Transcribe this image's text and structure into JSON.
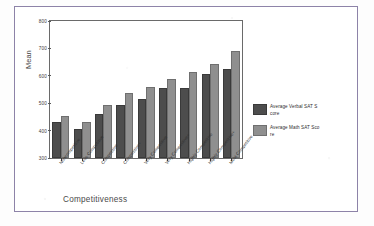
{
  "figure": {
    "outer_border_color": "#8d83a8",
    "background": "#ffffff"
  },
  "chart_data": {
    "type": "bar",
    "title": "",
    "xlabel": "Competitiveness",
    "ylabel": "Mean",
    "ylim": [
      300,
      800
    ],
    "yticks": [
      300,
      400,
      500,
      600,
      700,
      800
    ],
    "grid": false,
    "legend_position": "right",
    "categories": [
      "Noncompetitive",
      "Less Competitive",
      "Competitive",
      "Competitive+",
      "Very Competitive",
      "Very Competitive+",
      "Highly Competitive",
      "Highly Competitive+",
      "Most Competitive"
    ],
    "series": [
      {
        "name": "Average Verbal SAT Score",
        "color": "#4d4d4d",
        "values": [
          425,
          397,
          452,
          488,
          508,
          550,
          550,
          600,
          618
        ]
      },
      {
        "name": "Average Math SAT Score",
        "color": "#8f8f8f",
        "values": [
          447,
          425,
          487,
          530,
          553,
          582,
          608,
          637,
          684
        ]
      }
    ]
  },
  "legend": {
    "items": [
      {
        "swatch": "verbal",
        "line1": "Average Verbal SAT S",
        "line2": "core"
      },
      {
        "swatch": "math",
        "line1": "Average Math SAT Sco",
        "line2": "re"
      }
    ]
  }
}
